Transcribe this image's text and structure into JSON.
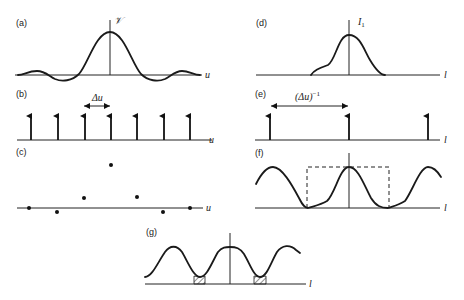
{
  "panels": {
    "a": {
      "label": "(a)",
      "axis_label": "u",
      "ordinate_label": "𝒱"
    },
    "b": {
      "label": "(b)",
      "axis_label": "u",
      "spacing_label": "Δu"
    },
    "c": {
      "label": "(c)",
      "axis_label": "u"
    },
    "d": {
      "label": "(d)",
      "axis_label": "l",
      "ordinate_label": "I",
      "ordinate_sub": "1"
    },
    "e": {
      "label": "(e)",
      "axis_label": "l",
      "spacing_label": "(Δu)",
      "spacing_sup": "−1"
    },
    "f": {
      "label": "(f)",
      "axis_label": "l"
    },
    "g": {
      "label": "(g)",
      "axis_label": "l"
    }
  },
  "colors": {
    "ink": "#1a1a1a",
    "background": "#ffffff"
  }
}
